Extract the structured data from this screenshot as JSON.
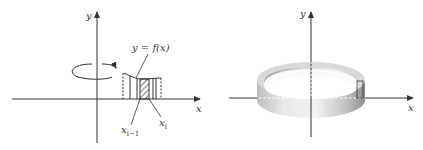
{
  "left_figure": {
    "y_axis_label": "y",
    "x_axis_label": "x",
    "curve_label": "y = f(x)",
    "left_tick_label_base": "x",
    "left_tick_label_sub": "i−1",
    "right_tick_label_base": "x",
    "right_tick_label_sub": "i",
    "rotation_arrow": "rotation-about-y-axis"
  },
  "right_figure": {
    "y_axis_label": "y",
    "x_axis_label": "x",
    "solid": "cylindrical-shell"
  },
  "colors": {
    "ink": "#333333",
    "shell_light": "#e8e8e8",
    "shell_dark": "#8c8c8c"
  }
}
